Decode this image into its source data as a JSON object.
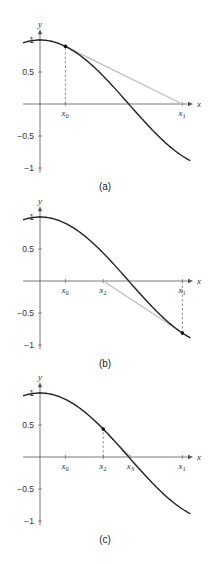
{
  "figure": {
    "panels": [
      {
        "caption": "(a)",
        "axis_labels": {
          "x": "x",
          "y": "y"
        },
        "y_ticks": [
          "1",
          "0.5",
          "−0.5",
          "−1"
        ],
        "x_markers": [
          {
            "label": "x",
            "sub": "0",
            "value": 0.45
          },
          {
            "label": "x",
            "sub": "1",
            "value": 2.52
          }
        ],
        "point": {
          "x": 0.45,
          "y": 0.9
        },
        "tangent": {
          "from": [
            0.45,
            0.9
          ],
          "to": [
            2.52,
            0
          ]
        }
      },
      {
        "caption": "(b)",
        "axis_labels": {
          "x": "x",
          "y": "y"
        },
        "y_ticks": [
          "1",
          "0.5",
          "−0.5",
          "−1"
        ],
        "x_markers": [
          {
            "label": "x",
            "sub": "0",
            "value": 0.45
          },
          {
            "label": "x",
            "sub": "2",
            "value": 1.12
          },
          {
            "label": "x",
            "sub": "1",
            "value": 2.52
          }
        ],
        "point": {
          "x": 2.52,
          "y": -0.814
        },
        "tangent": {
          "from": [
            1.12,
            0
          ],
          "to": [
            2.67,
            -0.9
          ]
        }
      },
      {
        "caption": "(c)",
        "axis_labels": {
          "x": "x",
          "y": "y"
        },
        "y_ticks": [
          "1",
          "0.5",
          "−0.5",
          "−1"
        ],
        "x_markers": [
          {
            "label": "x",
            "sub": "0",
            "value": 0.45
          },
          {
            "label": "x",
            "sub": "2",
            "value": 1.12
          },
          {
            "label": "x",
            "sub": "3",
            "value": 1.604
          },
          {
            "label": "x",
            "sub": "1",
            "value": 2.52
          }
        ],
        "point": {
          "x": 1.12,
          "y": 0.436
        },
        "tangent": {
          "from": [
            0.98,
            0.56
          ],
          "to": [
            1.604,
            0
          ]
        }
      }
    ],
    "colors": {
      "curve": "#222222",
      "tangent": "#bdbdbd",
      "axis": "#555555",
      "dash": "#777777"
    }
  }
}
